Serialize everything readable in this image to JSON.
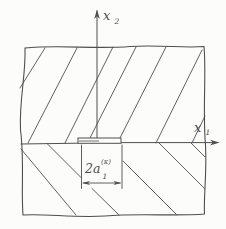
{
  "figure": {
    "colors": {
      "line": "#4f4f4f",
      "background": "#fcfcfb"
    },
    "axis_labels": {
      "vertical": {
        "symbol": "x",
        "subscript": "2"
      },
      "horizontal": {
        "symbol": "x",
        "subscript": "1"
      }
    },
    "crack_label": {
      "base": "2a",
      "subscript": "1",
      "superscript": "(κ)"
    }
  }
}
